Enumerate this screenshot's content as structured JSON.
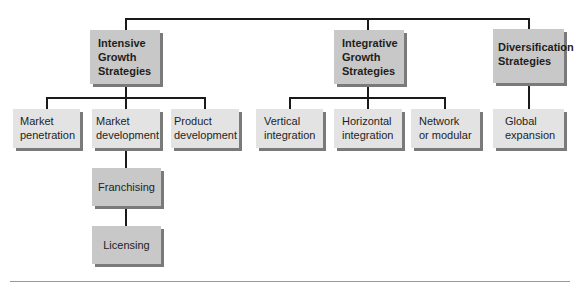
{
  "diagram": {
    "type": "hierarchy",
    "top_level": [
      {
        "label": "Intensive\nGrowth\nStrategies",
        "children": [
          {
            "label": "Market\npenetration"
          },
          {
            "label": "Market\ndevelopment",
            "children": [
              {
                "label": "Franchising",
                "children": [
                  {
                    "label": "Licensing"
                  }
                ]
              }
            ]
          },
          {
            "label": "Product\ndevelopment"
          }
        ]
      },
      {
        "label": "Integrative\nGrowth\nStrategies",
        "children": [
          {
            "label": "Vertical\nintegration"
          },
          {
            "label": "Horizontal\nintegration"
          },
          {
            "label": "Network\nor modular"
          }
        ]
      },
      {
        "label": "Diversification\nStrategies",
        "children": [
          {
            "label": "Global\nexpansion"
          }
        ]
      }
    ]
  },
  "colors": {
    "head_box": "#c8c8c8",
    "child_box": "#e3e3e3",
    "sub_box": "#c8c8c8",
    "shadow": "#7a7a7a",
    "line": "#1a1a1a"
  }
}
